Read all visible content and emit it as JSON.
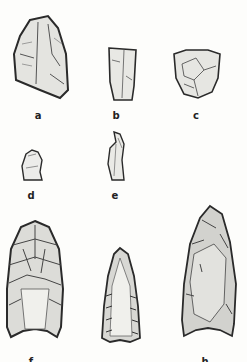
{
  "plate": {
    "description": "Line drawings of flaked stone artifacts",
    "background": "#fdfdfb",
    "ink": "#2a2a2a"
  },
  "artifacts": [
    {
      "id": "a",
      "label": "a",
      "type": "scraper"
    },
    {
      "id": "b",
      "label": "b",
      "type": "blade fragment"
    },
    {
      "id": "c",
      "label": "c",
      "type": "end scraper"
    },
    {
      "id": "d",
      "label": "d",
      "type": "small flake"
    },
    {
      "id": "e",
      "label": "e",
      "type": "narrow flake"
    },
    {
      "id": "f",
      "label": "f",
      "type": "fluted point"
    },
    {
      "id": "g",
      "label": "g",
      "type": "fluted point"
    },
    {
      "id": "h",
      "label": "h",
      "type": "fluted point"
    }
  ]
}
